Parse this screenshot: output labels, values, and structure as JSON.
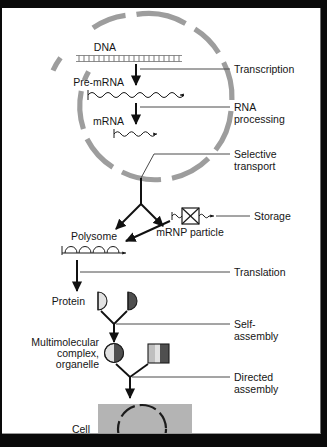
{
  "figure": {
    "background_color": "#ffffff",
    "border_color": "#0a0a0a"
  },
  "nucleus": {
    "name": "nuclear envelope",
    "pore_count": 10,
    "envelope_color": "#9d9d9d"
  },
  "molecules": {
    "dna_label": "DNA",
    "pre_mrna_label": "Pre-mRNA",
    "mrna_label": "mRNA",
    "polysome_label": "Polysome",
    "mrnp_label": "mRNP particle",
    "protein_label": "Protein",
    "complex_label_line1": "Multimolecular",
    "complex_label_line2": "complex,",
    "complex_label_line3": "organelle",
    "cell_label": "Cell"
  },
  "process_labels": {
    "transcription": "Transcription",
    "rna_processing_line1": "RNA",
    "rna_processing_line2": "processing",
    "selective_transport_line1": "Selective",
    "selective_transport_line2": "transport",
    "storage": "Storage",
    "translation": "Translation",
    "self_assembly_line1": "Self-",
    "self_assembly_line2": "assembly",
    "directed_assembly_line1": "Directed",
    "directed_assembly_line2": "assembly"
  },
  "colors": {
    "text": "#151515",
    "lead_line": "#4a4a4a",
    "arrow": "#111111",
    "envelope": "#9d9d9d",
    "cell_fill": "#b4b4b4",
    "shape_light": "#e2e2e2",
    "shape_dark": "#4f4f4f",
    "shape_mid": "#bfbfbf"
  }
}
